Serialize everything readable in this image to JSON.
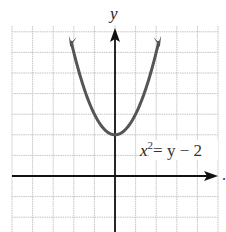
{
  "chart_data": {
    "type": "line",
    "title": "",
    "xlabel": "",
    "ylabel": "y",
    "equation": "x^2 = y - 2",
    "equation_parts": {
      "base": "x",
      "exp": "2",
      "rest": "= y − 2"
    },
    "series": [
      {
        "name": "x^2 = y - 2",
        "function": "y = x^2 + 2",
        "vertex": [
          0,
          2
        ],
        "x": [
          -2.2,
          -2,
          -1.5,
          -1,
          -0.5,
          0,
          0.5,
          1,
          1.5,
          2,
          2.2
        ],
        "y": [
          6.84,
          6,
          4.25,
          3,
          2.25,
          2,
          2.25,
          3,
          4.25,
          6,
          6.84
        ]
      }
    ],
    "xlim": [
      -5,
      5
    ],
    "ylim": [
      -2.7,
      7
    ],
    "grid": true,
    "axis_arrows": [
      "x-positive",
      "y-positive"
    ],
    "trailing_mark": "."
  },
  "labels": {
    "y_axis": "y",
    "trailing": "."
  },
  "colors": {
    "curve": "#555555",
    "axes": "#111111",
    "grid": "#bdbdbd"
  }
}
